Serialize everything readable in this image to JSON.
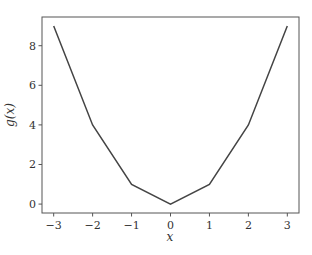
{
  "chart_data": {
    "type": "line",
    "title": "",
    "xlabel": "x",
    "ylabel": "g(x)",
    "x": [
      -3,
      -2,
      -1,
      0,
      1,
      2,
      3
    ],
    "series": [
      {
        "name": "g(x)",
        "values": [
          9,
          4,
          1,
          0,
          1,
          4,
          9
        ],
        "color": "#444444"
      }
    ],
    "xlim": [
      -3.3,
      3.3
    ],
    "ylim": [
      -0.45,
      9.45
    ],
    "xticks": [
      -3,
      -2,
      -1,
      0,
      1,
      2,
      3
    ],
    "xtick_labels": [
      "−3",
      "−2",
      "−1",
      "0",
      "1",
      "2",
      "3"
    ],
    "yticks": [
      0,
      2,
      4,
      6,
      8
    ],
    "ytick_labels": [
      "0",
      "2",
      "4",
      "6",
      "8"
    ],
    "grid": false,
    "legend": null
  }
}
